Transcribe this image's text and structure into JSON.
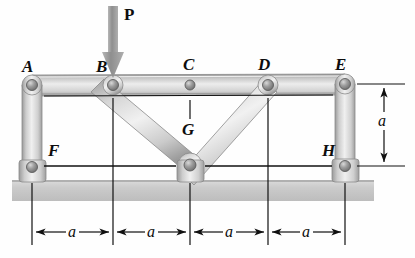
{
  "figure": {
    "type": "engineering-truss-diagram",
    "background_color": "#fefefe",
    "line_color": "#101010",
    "member_fill_light": "#e9e9e9",
    "member_fill_mid": "#c8c8c8",
    "member_fill_dark": "#9a9a9a",
    "ground_color": "#c9c9c9",
    "pin_color": "#8e8e8e"
  },
  "load": {
    "label": "P",
    "arrow_color": "#9c9c9c",
    "applied_at_joint": "B",
    "direction": "down"
  },
  "joints": [
    {
      "id": "A",
      "label": "A",
      "x": 32,
      "y": 85,
      "label_x": 22,
      "label_y": 58
    },
    {
      "id": "B",
      "label": "B",
      "x": 113,
      "y": 85,
      "label_x": 96,
      "label_y": 58
    },
    {
      "id": "C",
      "label": "C",
      "x": 190,
      "y": 85,
      "label_x": 183,
      "label_y": 56
    },
    {
      "id": "D",
      "label": "D",
      "x": 268,
      "y": 85,
      "label_x": 258,
      "label_y": 56
    },
    {
      "id": "E",
      "label": "E",
      "x": 345,
      "y": 84,
      "label_x": 335,
      "label_y": 56
    },
    {
      "id": "F",
      "label": "F",
      "x": 32,
      "y": 167,
      "label_x": 48,
      "label_y": 142
    },
    {
      "id": "G",
      "label": "G",
      "x": 190,
      "y": 165,
      "label_x": 182,
      "label_y": 118
    },
    {
      "id": "H",
      "label": "H",
      "x": 345,
      "y": 166,
      "label_x": 322,
      "label_y": 142
    }
  ],
  "members": [
    {
      "from": "A",
      "to": "E",
      "kind": "top-chord"
    },
    {
      "from": "A",
      "to": "F",
      "kind": "vertical-post"
    },
    {
      "from": "E",
      "to": "H",
      "kind": "vertical-post"
    },
    {
      "from": "B",
      "to": "G",
      "kind": "diagonal"
    },
    {
      "from": "D",
      "to": "G",
      "kind": "diagonal"
    },
    {
      "from": "F",
      "to": "H",
      "kind": "bottom-chord"
    }
  ],
  "supports": [
    {
      "at": "F",
      "type": "pin-on-ground"
    },
    {
      "at": "G",
      "type": "pin-on-ground"
    },
    {
      "at": "H",
      "type": "pin-on-ground"
    }
  ],
  "dimensions": {
    "horizontal": {
      "label": "a",
      "count": 4,
      "segments": [
        {
          "label": "a",
          "from_x": 32,
          "to_x": 113,
          "mid_x": 72,
          "y": 232
        },
        {
          "label": "a",
          "from_x": 113,
          "to_x": 190,
          "mid_x": 151,
          "y": 232
        },
        {
          "label": "a",
          "from_x": 190,
          "to_x": 268,
          "mid_x": 229,
          "y": 232
        },
        {
          "label": "a",
          "from_x": 268,
          "to_x": 345,
          "mid_x": 306,
          "y": 232
        }
      ]
    },
    "vertical": {
      "label": "a",
      "from_y": 84,
      "to_y": 166,
      "x": 384,
      "label_x": 390,
      "label_y": 118
    }
  },
  "ground": {
    "x": 12,
    "y": 180,
    "width": 362,
    "height": 21
  }
}
